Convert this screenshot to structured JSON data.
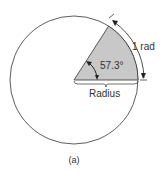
{
  "diagram": {
    "angle_label": "57.3°",
    "arc_label": "1 rad",
    "radius_label": "Radius",
    "caption": "(a)",
    "colors": {
      "sector_fill": "#c8c8c8",
      "stroke": "#333333",
      "background": "#ffffff"
    }
  }
}
